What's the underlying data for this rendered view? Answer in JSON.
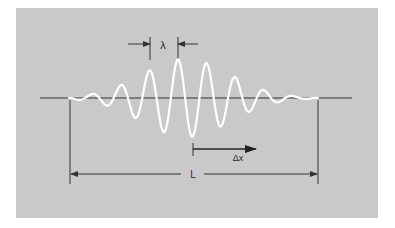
{
  "figure": {
    "type": "wave-packet-diagram",
    "labels": {
      "wavelength": "λ",
      "displacement": "Δx",
      "packet_length": "L"
    },
    "colors": {
      "background": "#ffffff",
      "panel": "#c9c9c9",
      "wave": "#ffffff",
      "lines": "#333333"
    }
  }
}
